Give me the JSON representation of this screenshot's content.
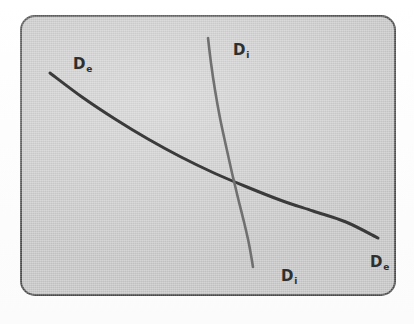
{
  "figure": {
    "panel": {
      "background_color": "#c8c8c8",
      "border_color": "#4d4d4d",
      "corner_radius": 15
    },
    "page_background_color": "#fdfdfd"
  },
  "labels": {
    "de_top": {
      "base": "D",
      "sub": "e"
    },
    "di_top": {
      "base": "D",
      "sub": "i"
    },
    "di_bottom": {
      "base": "D",
      "sub": "i"
    },
    "de_bottom": {
      "base": "D",
      "sub": "e"
    }
  },
  "chart_data": {
    "type": "line",
    "title": "",
    "xlabel": "",
    "ylabel": "",
    "grid": false,
    "legend": "inline-curve-labels",
    "axis_shown": false,
    "xlim": [
      0,
      376
    ],
    "ylim": [
      0,
      281
    ],
    "annotations": [
      {
        "text": "D_e",
        "x": 33,
        "y": 27,
        "series": "De"
      },
      {
        "text": "D_i",
        "x": 193,
        "y": 13,
        "series": "Di"
      },
      {
        "text": "D_i",
        "x": 241,
        "y": 239,
        "series": "Di"
      },
      {
        "text": "D_e",
        "x": 330,
        "y": 225,
        "series": "De"
      }
    ],
    "intersection": {
      "x": 207,
      "y": 181
    },
    "series": [
      {
        "name": "De",
        "label": "D_e",
        "description": "Elastic demand curve - shallow, convex to origin, downward sloping",
        "color": "#3a3a3a",
        "linewidth": 3,
        "x": [
          30,
          62,
          95,
          128,
          161,
          194,
          227,
          260,
          293,
          326,
          358
        ],
        "y": [
          58,
          82,
          104,
          124,
          142,
          158,
          172,
          185,
          196,
          207,
          223
        ]
      },
      {
        "name": "Di",
        "label": "D_i",
        "description": "Inelastic demand curve - steep, near vertical, downward sloping",
        "color": "#707070",
        "linewidth": 2.6,
        "x": [
          188,
          191,
          195,
          200,
          206,
          212,
          218,
          224,
          229,
          233
        ],
        "y": [
          23,
          48,
          75,
          103,
          131,
          158,
          183,
          207,
          229,
          252
        ]
      }
    ]
  }
}
